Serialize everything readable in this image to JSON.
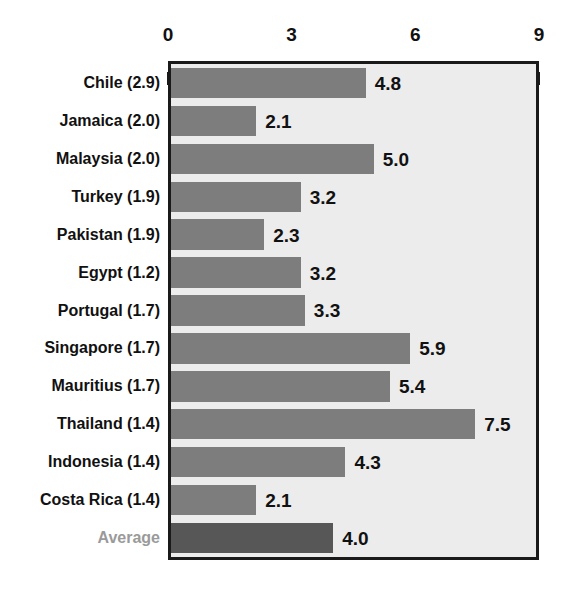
{
  "chart_data": {
    "type": "bar",
    "orientation": "horizontal",
    "title": "",
    "xlabel": "",
    "ylabel": "",
    "xlim": [
      0,
      9
    ],
    "xticks": [
      "0",
      "3",
      "6",
      "9"
    ],
    "xtick_values": [
      0,
      3,
      6,
      9
    ],
    "grid": false,
    "legend": null,
    "categories": [
      "Chile (2.9)",
      "Jamaica (2.0)",
      "Malaysia (2.0)",
      "Turkey (1.9)",
      "Pakistan (1.9)",
      "Egypt (1.2)",
      "Portugal (1.7)",
      "Singapore (1.7)",
      "Mauritius (1.7)",
      "Thailand (1.4)",
      "Indonesia (1.4)",
      "Costa Rica (1.4)",
      "Average"
    ],
    "values": [
      4.8,
      2.1,
      5.0,
      3.2,
      2.3,
      3.2,
      3.3,
      5.9,
      5.4,
      7.5,
      4.3,
      2.1,
      4.0
    ],
    "value_labels": [
      "4.8",
      "2.1",
      "5.0",
      "3.2",
      "2.3",
      "3.2",
      "3.3",
      "5.9",
      "5.4",
      "7.5",
      "4.3",
      "2.1",
      "4.0"
    ],
    "highlight_index": 12,
    "colors": {
      "bar": "#7d7d7d",
      "bar_highlight": "#575757",
      "plot_background": "#ececec",
      "frame": "#1a1a1a",
      "label": "#111111",
      "label_muted": "#9a9a9a"
    }
  }
}
